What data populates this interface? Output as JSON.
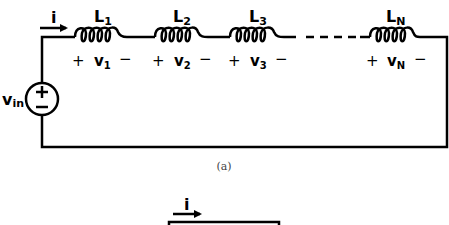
{
  "diagram": {
    "type": "circuit",
    "colors": {
      "wire": "#000000",
      "caption": "#444444",
      "background": "#ffffff"
    },
    "source": {
      "label": "v",
      "subscript": "in",
      "plus": "+",
      "minus": "−"
    },
    "current": {
      "label": "i"
    },
    "inductors": [
      {
        "label": "L",
        "subscript": "1",
        "voltage": "v",
        "voltage_subscript": "1",
        "plus": "+",
        "minus": "−"
      },
      {
        "label": "L",
        "subscript": "2",
        "voltage": "v",
        "voltage_subscript": "2",
        "plus": "+",
        "minus": "−"
      },
      {
        "label": "L",
        "subscript": "3",
        "voltage": "v",
        "voltage_subscript": "3",
        "plus": "+",
        "minus": "−"
      },
      {
        "label": "L",
        "subscript": "N",
        "voltage": "v",
        "voltage_subscript": "N",
        "plus": "+",
        "minus": "−"
      }
    ],
    "caption_a": "(a)",
    "part_b": {
      "current": {
        "label": "i"
      }
    }
  }
}
